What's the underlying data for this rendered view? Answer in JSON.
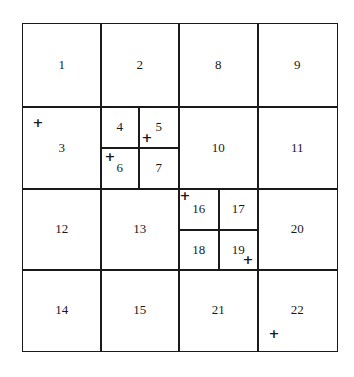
{
  "diagram": {
    "type": "quadtree-grid",
    "cells": [
      {
        "label": "1",
        "x": 22,
        "y": 23,
        "w": 78,
        "h": 83
      },
      {
        "label": "2",
        "x": 100,
        "y": 23,
        "w": 78,
        "h": 83
      },
      {
        "label": "8",
        "x": 178,
        "y": 23,
        "w": 79,
        "h": 83
      },
      {
        "label": "9",
        "x": 257,
        "y": 23,
        "w": 79,
        "h": 83
      },
      {
        "label": "3",
        "x": 22,
        "y": 106,
        "w": 78,
        "h": 82
      },
      {
        "label": "4",
        "x": 100,
        "y": 106,
        "w": 38,
        "h": 41
      },
      {
        "label": "5",
        "x": 138,
        "y": 106,
        "w": 40,
        "h": 41
      },
      {
        "label": "6",
        "x": 100,
        "y": 147,
        "w": 38,
        "h": 41
      },
      {
        "label": "7",
        "x": 138,
        "y": 147,
        "w": 40,
        "h": 41
      },
      {
        "label": "10",
        "x": 178,
        "y": 106,
        "w": 79,
        "h": 82
      },
      {
        "label": "11",
        "x": 257,
        "y": 106,
        "w": 79,
        "h": 82
      },
      {
        "label": "12",
        "x": 22,
        "y": 188,
        "w": 78,
        "h": 81
      },
      {
        "label": "13",
        "x": 100,
        "y": 188,
        "w": 78,
        "h": 81
      },
      {
        "label": "16",
        "x": 178,
        "y": 188,
        "w": 40,
        "h": 41
      },
      {
        "label": "17",
        "x": 218,
        "y": 188,
        "w": 39,
        "h": 41
      },
      {
        "label": "18",
        "x": 178,
        "y": 229,
        "w": 40,
        "h": 40
      },
      {
        "label": "19",
        "x": 218,
        "y": 229,
        "w": 39,
        "h": 40
      },
      {
        "label": "20",
        "x": 257,
        "y": 188,
        "w": 79,
        "h": 81
      },
      {
        "label": "14",
        "x": 22,
        "y": 269,
        "w": 78,
        "h": 81
      },
      {
        "label": "15",
        "x": 100,
        "y": 269,
        "w": 78,
        "h": 81
      },
      {
        "label": "21",
        "x": 178,
        "y": 269,
        "w": 79,
        "h": 81
      },
      {
        "label": "22",
        "x": 257,
        "y": 269,
        "w": 79,
        "h": 81
      }
    ],
    "points": [
      {
        "cell": "3",
        "x": 38,
        "y": 122,
        "glyph": "+"
      },
      {
        "cell": "5",
        "x": 147,
        "y": 137,
        "glyph": "+"
      },
      {
        "cell": "6",
        "x": 110,
        "y": 156,
        "glyph": "+"
      },
      {
        "cell": "16",
        "x": 185,
        "y": 195,
        "glyph": "+"
      },
      {
        "cell": "19",
        "x": 248,
        "y": 259,
        "glyph": "+"
      },
      {
        "cell": "22",
        "x": 274,
        "y": 333,
        "glyph": "+"
      }
    ]
  }
}
